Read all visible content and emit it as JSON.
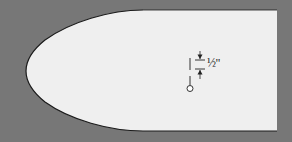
{
  "diagram": {
    "dimension_label": "½\"",
    "colors": {
      "background": "#777777",
      "shape_fill": "#efefef",
      "outline": "#1a1a1a"
    },
    "elements": [
      {
        "type": "bullet-shaped-outline",
        "description": "Rounded pointed template shape"
      },
      {
        "type": "dimension-marker",
        "label": "½\""
      },
      {
        "type": "hole-marker",
        "description": "Small circle with vertical line"
      }
    ]
  }
}
